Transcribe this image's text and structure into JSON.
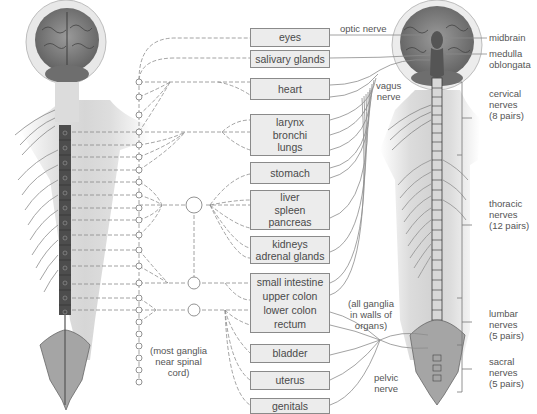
{
  "diagram": {
    "organs": [
      {
        "id": "eyes",
        "lines": [
          "eyes"
        ],
        "top": 26,
        "height": 18
      },
      {
        "id": "salivary",
        "lines": [
          "salivary glands"
        ],
        "top": 50,
        "height": 18
      },
      {
        "id": "heart",
        "lines": [
          "heart"
        ],
        "top": 76,
        "height": 26
      },
      {
        "id": "lungs",
        "lines": [
          "larynx",
          "bronchi",
          "lungs"
        ],
        "top": 114,
        "height": 46
      },
      {
        "id": "stomach",
        "lines": [
          "stomach"
        ],
        "top": 162,
        "height": 24
      },
      {
        "id": "liver",
        "lines": [
          "liver",
          "spleen",
          "pancreas"
        ],
        "top": 190,
        "height": 46
      },
      {
        "id": "kidneys",
        "lines": [
          "kidneys",
          "adrenal glands"
        ],
        "top": 236,
        "height": 28
      },
      {
        "id": "intestine",
        "lines": [
          "small intestine",
          "upper colon",
          "lower colon",
          "rectum"
        ],
        "top": 272,
        "height": 62
      },
      {
        "id": "bladder",
        "lines": [
          "bladder"
        ],
        "top": 343,
        "height": 20
      },
      {
        "id": "uterus",
        "lines": [
          "uterus"
        ],
        "top": 370,
        "height": 20
      },
      {
        "id": "genitals",
        "lines": [
          "genitals"
        ],
        "top": 398,
        "height": 16
      }
    ],
    "nerve_labels": {
      "optic": "optic nerve",
      "vagus": [
        "vagus",
        "nerve"
      ],
      "pelvic": [
        "pelvic",
        "nerve"
      ]
    },
    "ganglia_notes": {
      "sympathetic": [
        "(most ganglia",
        "near spinal",
        "cord)"
      ],
      "parasympathetic": [
        "(all ganglia",
        "in walls of",
        "organs)"
      ]
    },
    "brain_labels": {
      "midbrain": "midbrain",
      "medulla": [
        "medulla",
        "oblongata"
      ]
    },
    "spinal_regions": [
      {
        "name": [
          "cervical",
          "nerves",
          "(8 pairs)"
        ],
        "top": 82,
        "bottom": 155
      },
      {
        "name": [
          "thoracic",
          "nerves",
          "(12 pairs)"
        ],
        "top": 155,
        "bottom": 298
      },
      {
        "name": [
          "lumbar",
          "nerves",
          "(5 pairs)"
        ],
        "top": 298,
        "bottom": 345
      },
      {
        "name": [
          "sacral",
          "nerves",
          "(5 pairs)"
        ],
        "top": 345,
        "bottom": 392
      }
    ],
    "colors": {
      "box_fill": "#ececec",
      "box_border": "#8a8a8a",
      "line": "#8c8c8c",
      "text": "#555555",
      "spine_dark": "#4a4a4a"
    }
  }
}
